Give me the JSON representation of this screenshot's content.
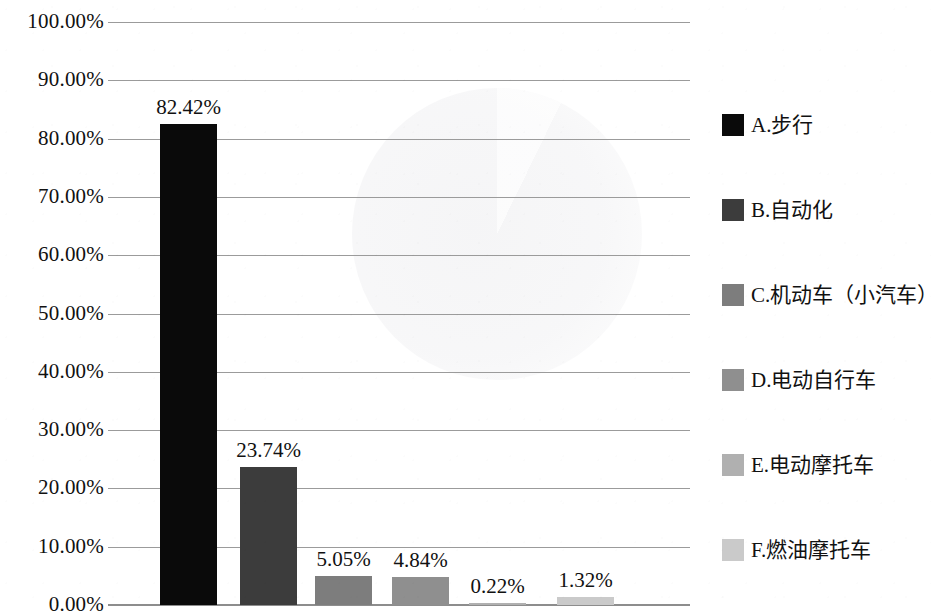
{
  "chart_data": {
    "type": "bar",
    "title": "",
    "xlabel": "",
    "ylabel": "",
    "ylim": [
      0,
      100
    ],
    "grid": true,
    "legend_position": "right",
    "value_suffix": "%",
    "categories": [
      "A.步行",
      "B.自动化",
      "C.机动车（小汽车）",
      "D.电动自行车",
      "E.电动摩托车",
      "F.燃油摩托车"
    ],
    "values": [
      82.42,
      23.74,
      5.05,
      4.84,
      0.22,
      1.32
    ],
    "value_labels": [
      "82.42%",
      "23.74%",
      "5.05%",
      "4.84%",
      "0.22%",
      "1.32%"
    ],
    "colors": [
      "#0a0a0a",
      "#3c3c3c",
      "#7d7d7d",
      "#8f8f8f",
      "#b0b0b0",
      "#cacaca"
    ],
    "y_ticks": [
      {
        "value": 100,
        "label": "100.00%"
      },
      {
        "value": 90,
        "label": "90.00%"
      },
      {
        "value": 80,
        "label": "80.00%"
      },
      {
        "value": 70,
        "label": "70.00%"
      },
      {
        "value": 60,
        "label": "60.00%"
      },
      {
        "value": 50,
        "label": "50.00%"
      },
      {
        "value": 40,
        "label": "40.00%"
      },
      {
        "value": 30,
        "label": "30.00%"
      },
      {
        "value": 20,
        "label": "20.00%"
      },
      {
        "value": 10,
        "label": "10.00%"
      },
      {
        "value": 0,
        "label": "0.00%"
      }
    ],
    "legend": [
      {
        "label": "A.步行",
        "color": "#0a0a0a"
      },
      {
        "label": "B.自动化",
        "color": "#3c3c3c"
      },
      {
        "label": "C.机动车（小汽车）",
        "color": "#7d7d7d"
      },
      {
        "label": "D.电动自行车",
        "color": "#8f8f8f"
      },
      {
        "label": "E.电动摩托车",
        "color": "#b0b0b0"
      },
      {
        "label": "F.燃油摩托车",
        "color": "#cacaca"
      }
    ]
  }
}
